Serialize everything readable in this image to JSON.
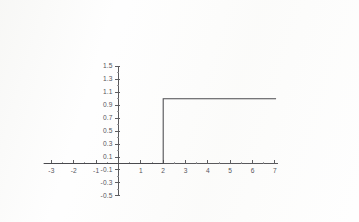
{
  "figure": {
    "background_color": "#fefefe",
    "axis_color": "#59595c",
    "curve_color": "#4a4a4e",
    "tick_label_color": "#55555a"
  },
  "chart_data": {
    "type": "line",
    "title": "",
    "subtitle": "",
    "xlabel": "",
    "ylabel": "",
    "function": "u(t-2)",
    "step_location": 2,
    "low_value": 0,
    "high_value": 1,
    "xlim": [
      -3.35,
      7.15
    ],
    "ylim": [
      -0.5,
      1.5
    ],
    "grid": false,
    "legend": false,
    "legend_position": "none",
    "x_major_ticks": [
      -3,
      -2,
      -1,
      0,
      1,
      2,
      3,
      4,
      5,
      6,
      7
    ],
    "x_tick_labels": [
      "-3",
      "-2",
      "-1",
      "",
      "1",
      "2",
      "3",
      "4",
      "5",
      "6",
      "7"
    ],
    "x_minor_ticks": [
      -2.5,
      -1.5,
      -0.5,
      0.5,
      1.5,
      2.5,
      3.5,
      4.5,
      5.5,
      6.5
    ],
    "y_major_ticks": [
      1.5,
      1.3,
      1.1,
      0.9,
      0.7,
      0.5,
      0.3,
      0.1,
      -0.1,
      -0.3,
      -0.5
    ],
    "y_tick_labels": [
      "1.5",
      "1.3",
      "1.1",
      "0.9",
      "0.7",
      "0.5",
      "0.3",
      "0.1",
      "-0.1",
      "-0.3",
      "-0.5"
    ],
    "y_minor_ticks": [
      1.4,
      1.2,
      1.0,
      0.8,
      0.6,
      0.4,
      0.2,
      0.0,
      -0.2,
      -0.4
    ],
    "series": [
      {
        "name": "u(t-2)",
        "x": [
          -3.35,
          2,
          2,
          7.05
        ],
        "values": [
          0,
          0,
          1,
          1
        ]
      }
    ]
  }
}
